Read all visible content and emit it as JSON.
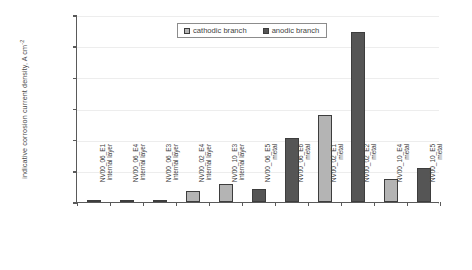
{
  "chart_data": {
    "type": "bar",
    "title": "",
    "xlabel": "",
    "ylabel": "indicative corrosion current density, A cm",
    "ylabel_exponent": "-2",
    "ylim": [
      0,
      0.00012
    ],
    "ytick_labels": [
      "1.2E-04",
      "1.0E-04",
      "8.0E-05",
      "6.0E-05",
      "4.0E-05",
      "2.0E-05",
      "0.0E+00"
    ],
    "ytick_values": [
      0.00012,
      0.0001,
      8e-05,
      6e-05,
      4e-05,
      2e-05,
      0
    ],
    "grid": true,
    "legend_position": "top-center",
    "categories": [
      {
        "line1": "NV00_06_E1",
        "line2": "internal layer"
      },
      {
        "line1": "NV00_06_E4",
        "line2": "internal layer"
      },
      {
        "line1": "NV00_06_E3",
        "line2": "internal layer"
      },
      {
        "line1": "NV00_02_E4",
        "line2": "internal layer"
      },
      {
        "line1": "NV00_10_E3",
        "line2": "internal layer"
      },
      {
        "line1": "NV00_06_E5",
        "line2": "metal"
      },
      {
        "line1": "NV00_06_E6",
        "line2": "metal"
      },
      {
        "line1": "NV00_02_E1",
        "line2": "metal"
      },
      {
        "line1": "NV00_02_E2",
        "line2": "metal"
      },
      {
        "line1": "NV00_10_E4",
        "line2": "metal"
      },
      {
        "line1": "NV00_10_E5",
        "line2": "metal"
      }
    ],
    "series": [
      {
        "name": "cathodic branch",
        "color": "#b4b4b4",
        "values": [
          null,
          1.2e-06,
          null,
          7.2e-06,
          1.15e-05,
          null,
          null,
          5.58e-05,
          null,
          1.48e-05,
          null
        ]
      },
      {
        "name": "anodic branch",
        "color": "#555555",
        "values": [
          1e-06,
          null,
          1e-06,
          null,
          null,
          8.2e-06,
          4.08e-05,
          null,
          0.000109,
          null,
          2.18e-05
        ]
      }
    ],
    "bars": [
      {
        "category_index": 0,
        "series": "anodic",
        "value": 1e-06
      },
      {
        "category_index": 1,
        "series": "cathodic",
        "value": 1.2e-06
      },
      {
        "category_index": 2,
        "series": "anodic",
        "value": 1e-06
      },
      {
        "category_index": 3,
        "series": "cathodic",
        "value": 7.2e-06
      },
      {
        "category_index": 4,
        "series": "cathodic",
        "value": 1.15e-05
      },
      {
        "category_index": 5,
        "series": "anodic",
        "value": 8.2e-06
      },
      {
        "category_index": 6,
        "series": "anodic",
        "value": 4.08e-05
      },
      {
        "category_index": 7,
        "series": "cathodic",
        "value": 5.58e-05
      },
      {
        "category_index": 8,
        "series": "anodic",
        "value": 0.000109
      },
      {
        "category_index": 9,
        "series": "cathodic",
        "value": 1.48e-05
      },
      {
        "category_index": 10,
        "series": "anodic",
        "value": 2.18e-05
      }
    ],
    "legend": [
      {
        "label": "cathodic branch",
        "swatch": "cathodic"
      },
      {
        "label": "anodic branch",
        "swatch": "anodic"
      }
    ]
  }
}
